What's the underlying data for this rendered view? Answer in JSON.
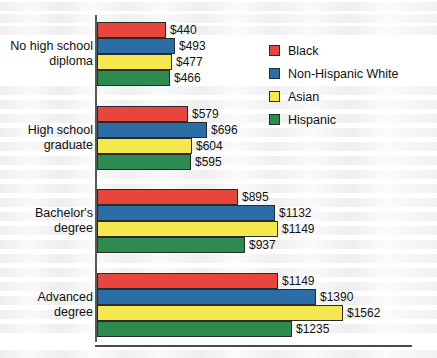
{
  "chart_data": {
    "type": "bar",
    "orientation": "horizontal",
    "title": "",
    "subtitle": "",
    "xlabel": "",
    "ylabel": "",
    "grid": false,
    "legend_position": "top-right",
    "xlim": [
      0,
      1562
    ],
    "categories": [
      "No high school\ndiploma",
      "High school\ngraduate",
      "Bachelor's\ndegree",
      "Advanced\ndegree"
    ],
    "series": [
      {
        "name": "Black",
        "color": "#e8453c",
        "values": [
          440,
          579,
          895,
          1149
        ]
      },
      {
        "name": "Non-Hispanic White",
        "color": "#2d6da6",
        "values": [
          493,
          696,
          1132,
          1390
        ]
      },
      {
        "name": "Asian",
        "color": "#f4e84e",
        "values": [
          477,
          604,
          1149,
          1562
        ]
      },
      {
        "name": "Hispanic",
        "color": "#2e8b4f",
        "values": [
          466,
          595,
          937,
          1235
        ]
      }
    ],
    "value_labels": [
      [
        "$440",
        "$493",
        "$477",
        "$466"
      ],
      [
        "$579",
        "$696",
        "$604",
        "$595"
      ],
      [
        "$895",
        "$1132",
        "$1149",
        "$937"
      ],
      [
        "$1149",
        "$1390",
        "$1562",
        "$1235"
      ]
    ]
  },
  "legend": {
    "items": [
      {
        "label": "Black",
        "color": "#e8453c"
      },
      {
        "label": "Non-Hispanic White",
        "color": "#2d6da6"
      },
      {
        "label": "Asian",
        "color": "#f4e84e"
      },
      {
        "label": "Hispanic",
        "color": "#2e8b4f"
      }
    ]
  },
  "axis": {
    "colors": {
      "line": "#4a4a4a",
      "bar_outline": "#2a2a2a",
      "text": "#111111"
    }
  }
}
